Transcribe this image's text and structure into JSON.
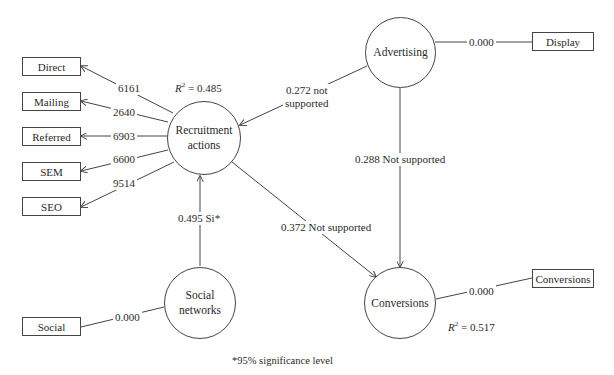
{
  "diagram": {
    "type": "structural-equation-model",
    "constructs": [
      {
        "id": "recruitment",
        "label_line1": "Recruitment",
        "label_line2": "actions",
        "r2_prefix": "R",
        "r2_sup": "2",
        "r2_value": " = 0.485"
      },
      {
        "id": "advertising",
        "label": "Advertising"
      },
      {
        "id": "social_networks",
        "label_line1": "Social",
        "label_line2": "networks"
      },
      {
        "id": "conversions",
        "label": "Conversions",
        "r2_prefix": "R",
        "r2_sup": "2",
        "r2_value": " = 0.517"
      }
    ],
    "indicators": {
      "recruitment": [
        {
          "label": "Direct",
          "weight": "6161"
        },
        {
          "label": "Mailing",
          "weight": "2640"
        },
        {
          "label": "Referred",
          "weight": "6903"
        },
        {
          "label": "SEM",
          "weight": "6600"
        },
        {
          "label": "SEO",
          "weight": "9514"
        }
      ],
      "advertising": [
        {
          "label": "Display",
          "weight": "0.000"
        }
      ],
      "social_networks": [
        {
          "label": "Social",
          "weight": "0.000"
        }
      ],
      "conversions": [
        {
          "label": "Conversions",
          "weight": "0.000"
        }
      ]
    },
    "paths": [
      {
        "from": "advertising",
        "to": "recruitment",
        "label_line1": "0.272 not",
        "label_line2": "supported"
      },
      {
        "from": "advertising",
        "to": "conversions",
        "label": "0.288 Not supported"
      },
      {
        "from": "social_networks",
        "to": "recruitment",
        "label": "0.495 Si*"
      },
      {
        "from": "recruitment",
        "to": "conversions",
        "label": "0.372 Not supported"
      }
    ],
    "footnote": "*95% significance level"
  }
}
